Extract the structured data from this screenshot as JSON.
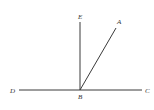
{
  "diagram": {
    "type": "geometry-angles",
    "points": {
      "D": {
        "label": "D",
        "x": 19,
        "y": 90
      },
      "C": {
        "label": "C",
        "x": 142,
        "y": 90
      },
      "B": {
        "label": "B",
        "x": 80,
        "y": 90
      },
      "E": {
        "label": "E",
        "x": 80,
        "y": 22
      },
      "A": {
        "label": "A",
        "x": 116,
        "y": 28
      }
    },
    "segments": [
      {
        "from": "D",
        "to": "C",
        "description": "straight line DC through B"
      },
      {
        "from": "B",
        "to": "E",
        "description": "ray BE perpendicular to DC"
      },
      {
        "from": "B",
        "to": "A",
        "description": "ray BA"
      }
    ],
    "colors": {
      "line": "#3a3a3a",
      "label": "#333333",
      "background": "#ffffff"
    }
  }
}
